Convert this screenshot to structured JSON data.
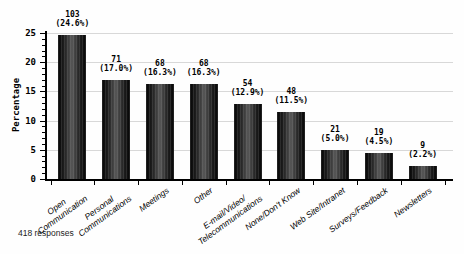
{
  "chart_data": {
    "type": "bar",
    "title": "",
    "xlabel": "",
    "ylabel": "Percentage",
    "footnote": "418 responses",
    "categories": [
      "Open\nCommunication",
      "Personal\nCommunications",
      "Meetings",
      "Other",
      "E-mail/Video/\nTelecommunications",
      "None/Don't Know",
      "Web Site/Intranet",
      "Surveys/Feedback",
      "Newsletters"
    ],
    "counts": [
      103,
      71,
      68,
      68,
      54,
      48,
      21,
      19,
      9
    ],
    "percents": [
      24.6,
      17.0,
      16.3,
      16.3,
      12.9,
      11.5,
      5.0,
      4.5,
      2.2
    ],
    "ylim": [
      0,
      25
    ],
    "yticks": [
      0,
      5,
      10,
      15,
      20,
      25
    ],
    "ytick_step": 5,
    "minor_tick_step": 1,
    "grid": true,
    "legend": "none",
    "colors": {
      "bar_dark": "#050505",
      "bar_highlight": "#575757",
      "gridline": "#d8d8d8",
      "axis": "#000000",
      "background": "#fefefe"
    }
  }
}
